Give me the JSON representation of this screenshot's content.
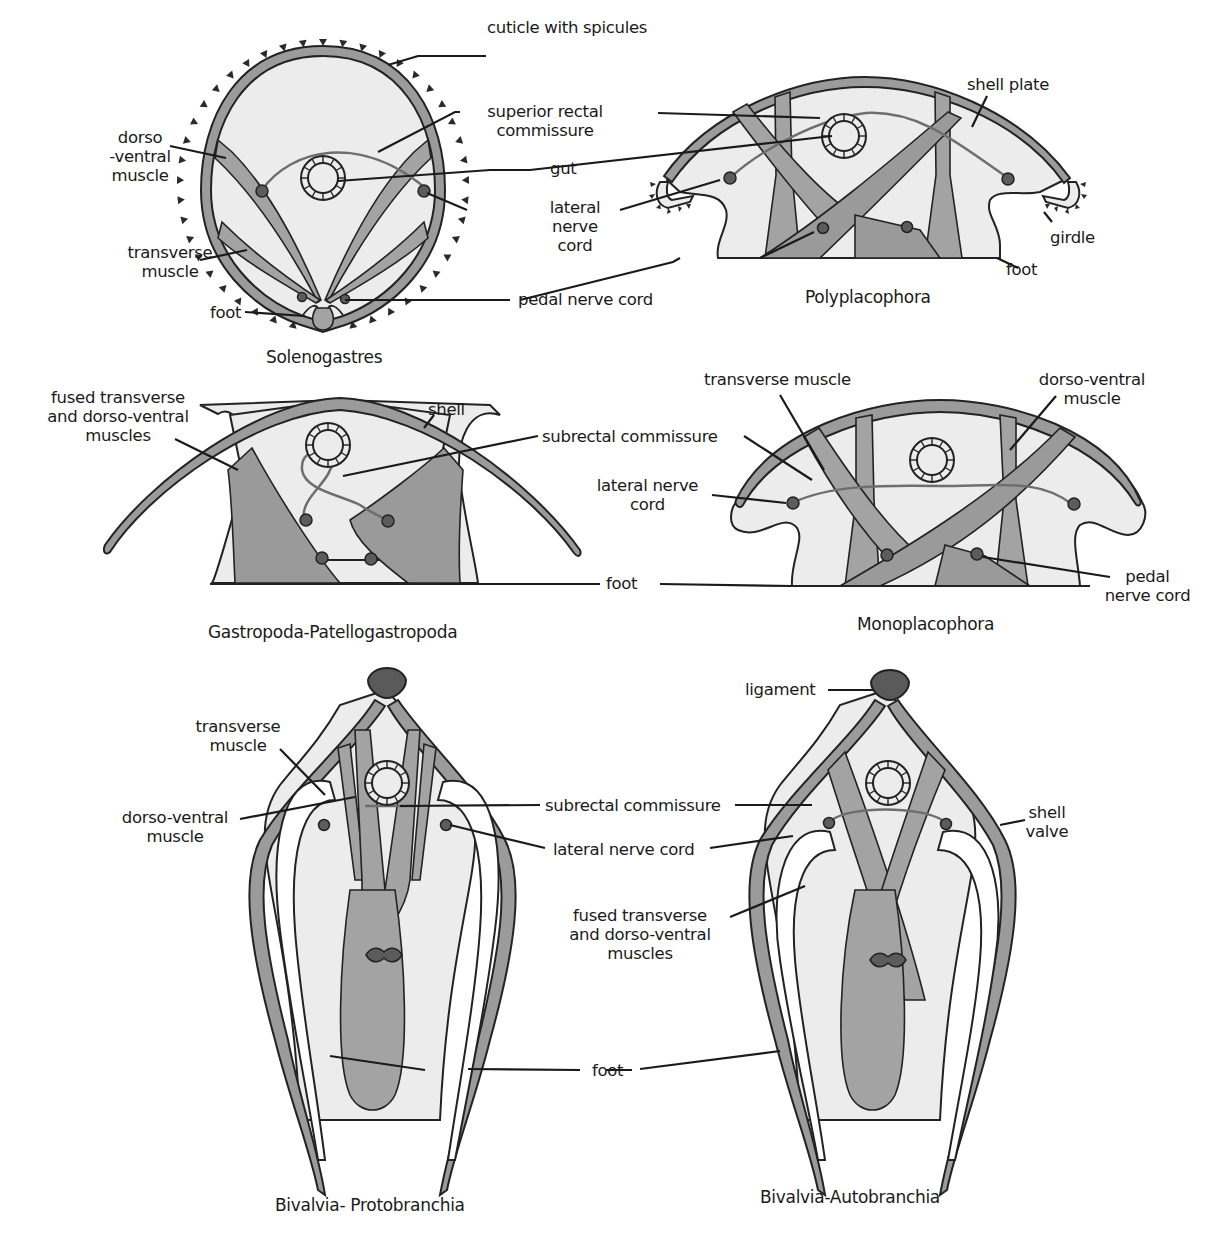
{
  "figure": {
    "colors": {
      "body_fill": "#ececec",
      "shell": "#9b9b9b",
      "muscle": "#a3a3a3",
      "nerve_node": "#5c5c5c",
      "ligament": "#5a5a5a",
      "outline": "#222222"
    },
    "panels": [
      {
        "id": "solenogastres",
        "title": "Solenogastres",
        "labels": [
          "cuticle with spicules",
          "superior rectal\ncommissure",
          "dorso\n-ventral\nmuscle",
          "gut",
          "lateral\nnerve\ncord",
          "transverse\nmuscle",
          "pedal nerve cord",
          "foot"
        ]
      },
      {
        "id": "polyplacophora",
        "title": "Polyplacophora",
        "labels": [
          "shell plate",
          "girdle",
          "foot"
        ]
      },
      {
        "id": "gastropoda",
        "title": "Gastropoda-Patellogastropoda",
        "labels": [
          "fused transverse\nand dorso-ventral\nmuscles",
          "shell",
          "subrectal commissure"
        ]
      },
      {
        "id": "monoplacophora",
        "title": "Monoplacophora",
        "labels": [
          "transverse muscle",
          "dorso-ventral\nmuscle",
          "lateral nerve\ncord",
          "foot",
          "pedal\nnerve cord"
        ]
      },
      {
        "id": "bivalvia_protobranchia",
        "title": "Bivalvia- Protobranchia",
        "labels": [
          "transverse\nmuscle",
          "dorso-ventral\nmuscle"
        ]
      },
      {
        "id": "bivalvia_autobranchia",
        "title": "Bivalvia-Autobranchia",
        "labels": [
          "ligament",
          "subrectal commissure",
          "shell\nvalve",
          "lateral nerve cord",
          "fused transverse\nand dorso-ventral\nmuscles",
          "foot"
        ]
      }
    ]
  },
  "text": {
    "sol_title": "Solenogastres",
    "sol_cuticle": "cuticle with spicules",
    "sol_superior_1": "superior rectal",
    "sol_superior_2": "commissure",
    "sol_dv_1": "dorso",
    "sol_dv_2": "-ventral",
    "sol_dv_3": "muscle",
    "sol_gut": "gut",
    "sol_lnc_1": "lateral",
    "sol_lnc_2": "nerve",
    "sol_lnc_3": "cord",
    "sol_tm_1": "transverse",
    "sol_tm_2": "muscle",
    "sol_pedal": "pedal nerve cord",
    "sol_foot": "foot",
    "poly_title": "Polyplacophora",
    "poly_shell": "shell plate",
    "poly_girdle": "girdle",
    "poly_foot": "foot",
    "gas_title": "Gastropoda-Patellogastropoda",
    "gas_fused_1": "fused transverse",
    "gas_fused_2": "and dorso-ventral",
    "gas_fused_3": "muscles",
    "gas_shell": "shell",
    "gas_subrectal": "subrectal commissure",
    "mono_title": "Monoplacophora",
    "mono_tm": "transverse muscle",
    "mono_dv_1": "dorso-ventral",
    "mono_dv_2": "muscle",
    "mono_lnc_1": "lateral nerve",
    "mono_lnc_2": "cord",
    "mono_foot": "foot",
    "mono_pedal_1": "pedal",
    "mono_pedal_2": "nerve cord",
    "bp_title": "Bivalvia- Protobranchia",
    "bp_tm_1": "transverse",
    "bp_tm_2": "muscle",
    "bp_dv_1": "dorso-ventral",
    "bp_dv_2": "muscle",
    "ba_title": "Bivalvia-Autobranchia",
    "ba_ligament": "ligament",
    "ba_subrectal": "subrectal commissure",
    "ba_shell_1": "shell",
    "ba_shell_2": "valve",
    "ba_lnc": "lateral nerve cord",
    "ba_fused_1": "fused transverse",
    "ba_fused_2": "and dorso-ventral",
    "ba_fused_3": "muscles",
    "ba_foot": "foot"
  }
}
